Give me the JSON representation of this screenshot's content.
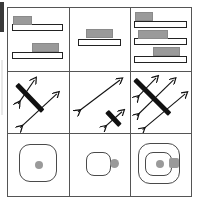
{
  "figure": {
    "grid": {
      "rows": 3,
      "cols": 3
    },
    "colors": {
      "stroke": "#555555",
      "shape_outline": "#222222",
      "block_fill": "#9a9a9a",
      "strike_bar": "#111111",
      "rounded_outline": "#4a4a4a",
      "background": "#ffffff"
    }
  },
  "cells": [
    {
      "id": "cell-r1c1",
      "row": 1,
      "col": 1,
      "type": "bars-with-blocks",
      "description": "Two horizontal outlined bars; top bar has gray block at left, bottom bar has gray block at right",
      "count": 2,
      "items": [
        {
          "bar_width_pct": 84,
          "block_align": "left",
          "block_width_pct": 30
        },
        {
          "bar_width_pct": 84,
          "block_align": "right",
          "block_width_pct": 44
        }
      ]
    },
    {
      "id": "cell-r1c2",
      "row": 1,
      "col": 2,
      "type": "bars-with-blocks",
      "description": "One horizontal outlined bar with gray block centered on top",
      "count": 1,
      "items": [
        {
          "bar_width_pct": 72,
          "block_align": "center",
          "block_width_pct": 44
        }
      ]
    },
    {
      "id": "cell-r1c3",
      "row": 1,
      "col": 3,
      "type": "bars-with-blocks",
      "description": "Three horizontal outlined bars with gray blocks at left, center and right",
      "count": 3,
      "items": [
        {
          "bar_width_pct": 88,
          "block_align": "left",
          "block_width_pct": 30
        },
        {
          "bar_width_pct": 88,
          "block_align": "center",
          "block_width_pct": 50
        },
        {
          "bar_width_pct": 88,
          "block_align": "right",
          "block_width_pct": 46
        }
      ]
    },
    {
      "id": "cell-r2c1",
      "row": 2,
      "col": 1,
      "type": "arrows-with-strike",
      "description": "Two thin double-headed diagonal arrows pointing up-right, one crossed out by a thick black bar",
      "arrow_count": 2,
      "strike_count": 1,
      "strike_length": "long"
    },
    {
      "id": "cell-r2c2",
      "row": 2,
      "col": 2,
      "type": "arrows-with-strike",
      "description": "One long thin double-headed diagonal arrow and one small arrow crossed out by a short thick black bar",
      "arrow_count": 2,
      "strike_count": 1,
      "strike_length": "short"
    },
    {
      "id": "cell-r2c3",
      "row": 2,
      "col": 3,
      "type": "arrows-with-strike",
      "description": "Three thin double-headed diagonal arrows crossed by one long thick black bar",
      "arrow_count": 3,
      "strike_count": 1,
      "strike_length": "long"
    },
    {
      "id": "cell-r3c1",
      "row": 3,
      "col": 1,
      "type": "rounded-square",
      "description": "Large rounded square with a gray dot at its center",
      "square_count": 1,
      "size": "large",
      "center_dot": true,
      "side_nub": false
    },
    {
      "id": "cell-r3c2",
      "row": 3,
      "col": 2,
      "type": "rounded-square",
      "description": "Small rounded square with a gray dot attached to its right edge",
      "square_count": 1,
      "size": "small",
      "center_dot": false,
      "side_nub": true
    },
    {
      "id": "cell-r3c3",
      "row": 3,
      "col": 3,
      "type": "rounded-square",
      "description": "Large rounded square containing a smaller rounded square with a center gray dot and a gray nub on its right edge",
      "square_count": 2,
      "size": "nested",
      "center_dot": true,
      "side_nub": true
    }
  ]
}
